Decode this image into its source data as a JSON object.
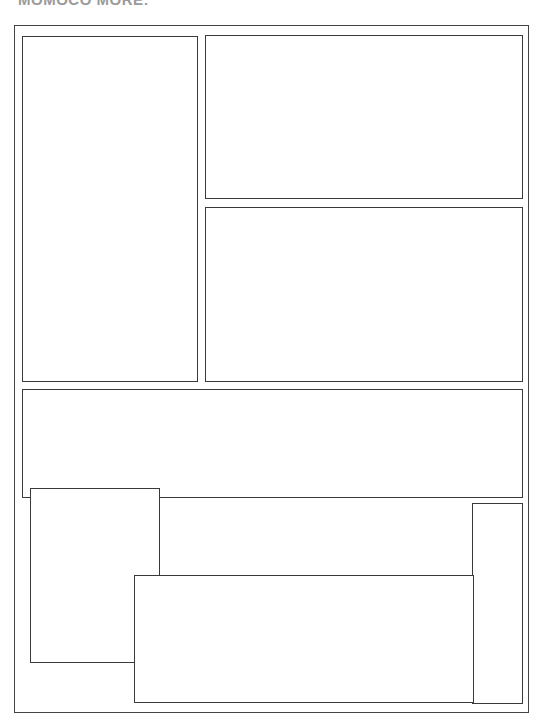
{
  "page": {
    "title": "MOMOCO MORE:"
  },
  "panels": [
    {
      "id": "panel-1",
      "label": ""
    },
    {
      "id": "panel-2",
      "label": ""
    },
    {
      "id": "panel-3",
      "label": ""
    },
    {
      "id": "panel-4",
      "label": ""
    },
    {
      "id": "panel-5",
      "label": ""
    },
    {
      "id": "panel-6",
      "label": ""
    },
    {
      "id": "panel-7",
      "label": ""
    }
  ],
  "colors": {
    "border": "#3a3a3a",
    "background": "#ffffff",
    "title": "#9a9a9a"
  }
}
